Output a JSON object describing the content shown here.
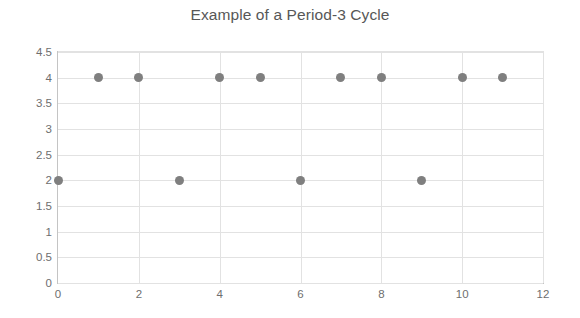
{
  "chart_data": {
    "type": "scatter",
    "title": "Example of a Period-3 Cycle",
    "xlabel": "",
    "ylabel": "",
    "xlim": [
      0,
      12
    ],
    "ylim": [
      0,
      4.5
    ],
    "grid": true,
    "legend": false,
    "legend_position": "none",
    "marker_color": "#7f7f7f",
    "marker_shape": "circle",
    "grid_color": "#e2e2e2",
    "axis_color": "#c4c4c4",
    "tick_label_color": "#6e6e6e",
    "title_color": "#575757",
    "background_color": "#ffffff",
    "x_ticks": [
      "0",
      "2",
      "4",
      "6",
      "8",
      "10",
      "12"
    ],
    "x_tick_values": [
      0,
      2,
      4,
      6,
      8,
      10,
      12
    ],
    "y_ticks": [
      "0",
      "0.5",
      "1",
      "1.5",
      "2",
      "2.5",
      "3",
      "3.5",
      "4",
      "4.5"
    ],
    "y_tick_values": [
      0,
      0.5,
      1,
      1.5,
      2,
      2.5,
      3,
      3.5,
      4,
      4.5
    ],
    "x": [
      0,
      1,
      2,
      3,
      4,
      5,
      6,
      7,
      8,
      9,
      10,
      11
    ],
    "y": [
      2,
      4,
      4,
      2,
      4,
      4,
      2,
      4,
      4,
      2,
      4,
      4
    ],
    "points": [
      {
        "x": 0,
        "y": 2
      },
      {
        "x": 1,
        "y": 4
      },
      {
        "x": 2,
        "y": 4
      },
      {
        "x": 3,
        "y": 2
      },
      {
        "x": 4,
        "y": 4
      },
      {
        "x": 5,
        "y": 4
      },
      {
        "x": 6,
        "y": 2
      },
      {
        "x": 7,
        "y": 4
      },
      {
        "x": 8,
        "y": 4
      },
      {
        "x": 9,
        "y": 2
      },
      {
        "x": 10,
        "y": 4
      },
      {
        "x": 11,
        "y": 4
      }
    ]
  }
}
